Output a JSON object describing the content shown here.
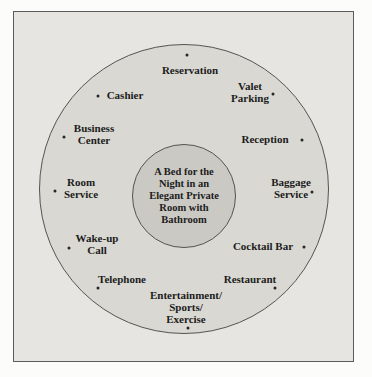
{
  "diagram": {
    "core": {
      "label": "A Bed for the\nNight in an\nElegant Private\nRoom with\nBathroom"
    },
    "ring": {
      "items": [
        {
          "label": "Reservation"
        },
        {
          "label": "Valet\nParking"
        },
        {
          "label": "Reception"
        },
        {
          "label": "Baggage\nService"
        },
        {
          "label": "Cocktail Bar"
        },
        {
          "label": "Restaurant"
        },
        {
          "label": "Entertainment/\nSports/\nExercise"
        },
        {
          "label": "Telephone"
        },
        {
          "label": "Wake-up\nCall"
        },
        {
          "label": "Room\nService"
        },
        {
          "label": "Business\nCenter"
        },
        {
          "label": "Cashier"
        }
      ]
    },
    "colors": {
      "frame_fill": "#e6e5e1",
      "ring_fill": "#d9d8d2",
      "core_fill": "#cbc9c3",
      "border": "#55544f",
      "text": "#1c1c1c"
    }
  }
}
